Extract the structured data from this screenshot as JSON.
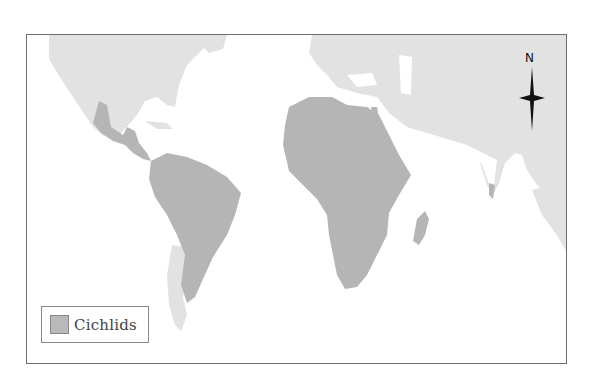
{
  "map": {
    "type": "world distribution map",
    "highlight_color": "#b5b5b5",
    "other_land_color": "#e2e2e2",
    "water_color": "#ffffff",
    "highlighted_regions": [
      "Central America",
      "South America (except southern tip)",
      "Africa",
      "Madagascar",
      "Southern India / Sri Lanka"
    ],
    "unhighlighted_regions": [
      "North America",
      "Europe",
      "Asia",
      "Southern South America",
      "Southeast Asia"
    ]
  },
  "legend": {
    "items": [
      {
        "label": "Cichlids",
        "color": "#b9b9b9"
      }
    ]
  },
  "compass": {
    "label": "N",
    "icon": "north-arrow-icon"
  }
}
